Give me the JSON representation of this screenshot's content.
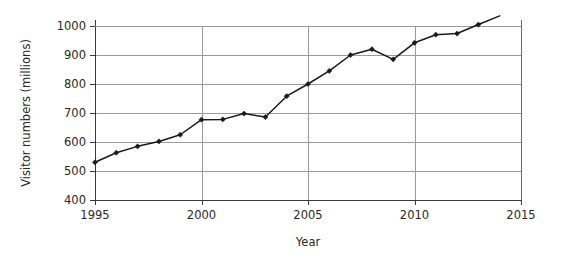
{
  "chart_data": {
    "type": "line",
    "title": "",
    "xlabel": "Year",
    "ylabel": "Visitor numbers (millions)",
    "xlim": [
      1995,
      2015
    ],
    "ylim": [
      400,
      1000
    ],
    "grid": true,
    "legend": "none",
    "x_ticks": [
      1995,
      2000,
      2005,
      2010,
      2015
    ],
    "x_tick_labels": [
      "1995",
      "2000",
      "2005",
      "2010",
      "2015"
    ],
    "y_ticks": [
      400,
      500,
      600,
      700,
      800,
      900,
      1000
    ],
    "y_tick_labels": [
      "400",
      "500",
      "600",
      "700",
      "800",
      "900",
      "1000"
    ],
    "marker": "diamond",
    "line_color": "#1a1a1a",
    "grid_color": "#9b9b9b",
    "x": [
      1995,
      1996,
      1997,
      1998,
      1999,
      2000,
      2001,
      2002,
      2003,
      2004,
      2005,
      2006,
      2007,
      2008,
      2009,
      2010,
      2011,
      2012,
      2013
    ],
    "values": [
      530,
      563,
      585,
      602,
      625,
      677,
      678,
      698,
      686,
      758,
      800,
      845,
      900,
      920,
      885,
      942,
      970,
      974,
      1005
    ],
    "line_extends_beyond_last_marker": true,
    "extension_end": {
      "x": 2014,
      "y": 1035
    }
  },
  "labels": {
    "y_axis_title": "Visitor numbers (millions)",
    "x_axis_title": "Year"
  }
}
